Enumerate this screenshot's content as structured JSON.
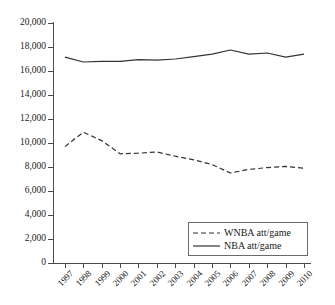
{
  "chart_data": {
    "type": "line",
    "title": "",
    "xlabel": "",
    "ylabel": "",
    "categories": [
      "1997",
      "1998",
      "1999",
      "2000",
      "2001",
      "2002",
      "2003",
      "2004",
      "2005",
      "2006",
      "2007",
      "2008",
      "2009",
      "2010"
    ],
    "ylim": [
      0,
      20000
    ],
    "ytick_values": [
      0,
      2000,
      4000,
      6000,
      8000,
      10000,
      12000,
      14000,
      16000,
      18000,
      20000
    ],
    "ytick_labels": [
      "0",
      "2,000",
      "4,000",
      "6,000",
      "8,000",
      "10,000",
      "12,000",
      "14,000",
      "16,000",
      "18,000",
      "20,000"
    ],
    "grid": false,
    "legend_position": "lower-right",
    "series": [
      {
        "name": "WNBA att/game",
        "style": "dashed",
        "color": "#333333",
        "values": [
          9700,
          10900,
          10200,
          9100,
          9150,
          9250,
          8900,
          8600,
          8200,
          7500,
          7800,
          7950,
          8050,
          7900
        ]
      },
      {
        "name": "NBA att/game",
        "style": "solid",
        "color": "#333333",
        "values": [
          17150,
          16750,
          16800,
          16800,
          16950,
          16900,
          17000,
          17200,
          17400,
          17750,
          17400,
          17500,
          17150,
          17400
        ]
      }
    ]
  },
  "legend": {
    "items": [
      {
        "label": "WNBA att/game",
        "style": "dashed"
      },
      {
        "label": "NBA att/game",
        "style": "solid"
      }
    ]
  }
}
